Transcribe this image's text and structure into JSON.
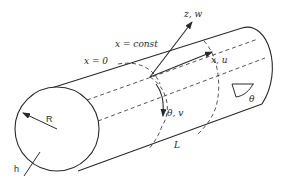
{
  "diagram": {
    "type": "cylindrical shell coordinate diagram",
    "colors": {
      "line": "#2a2a2a",
      "background": "#ffffff"
    },
    "labels": {
      "z_axis": "z, w",
      "x_axis": "x, u",
      "theta_axis": "θ, v",
      "x_const": "x = const",
      "x_zero": "x = 0",
      "theta_angle": "θ",
      "radius": "R",
      "thickness": "h",
      "length": "L"
    }
  }
}
